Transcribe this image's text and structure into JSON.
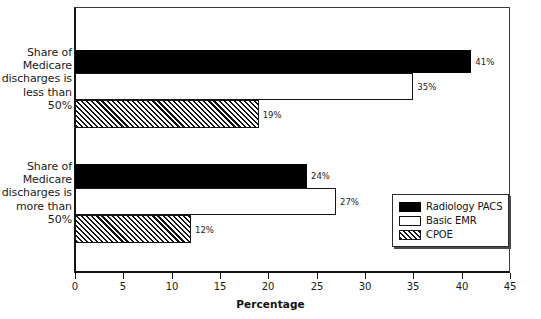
{
  "chart_data": {
    "type": "bar",
    "orientation": "horizontal",
    "title": "",
    "xlabel": "Percentage",
    "ylabel": "",
    "xlim": [
      0,
      45
    ],
    "xticks": [
      0,
      5,
      10,
      15,
      20,
      25,
      30,
      35,
      40,
      45
    ],
    "grid": false,
    "legend_position": "inside-bottom-right",
    "categories": [
      "Share of Medicare discharges is less than 50%",
      "Share of Medicare discharges is more than 50%"
    ],
    "category_lines": [
      [
        "Share of",
        "Medicare",
        "discharges is",
        "less than",
        "50%"
      ],
      [
        "Share of",
        "Medicare",
        "discharges is",
        "more than",
        "50%"
      ]
    ],
    "series": [
      {
        "name": "Radiology PACS",
        "fill": "solid-black",
        "color": "#000000",
        "values": [
          41,
          24
        ],
        "labels": [
          "41%",
          "24%"
        ]
      },
      {
        "name": "Basic EMR",
        "fill": "open-white",
        "color": "#ffffff",
        "values": [
          35,
          27
        ],
        "labels": [
          "35%",
          "27%"
        ]
      },
      {
        "name": "CPOE",
        "fill": "diagonal-hatch",
        "color": "#ffffff",
        "values": [
          19,
          12
        ],
        "labels": [
          "19%",
          "12%"
        ]
      }
    ]
  },
  "axis": {
    "tick_labels": [
      "0",
      "5",
      "10",
      "15",
      "20",
      "25",
      "30",
      "35",
      "40",
      "45"
    ],
    "title": "Percentage"
  },
  "legend": {
    "items": [
      {
        "label": "Radiology PACS",
        "swatch": "solid-black-swatch"
      },
      {
        "label": "Basic EMR",
        "swatch": "open-white-swatch"
      },
      {
        "label": "CPOE",
        "swatch": "hatched-swatch"
      }
    ]
  }
}
